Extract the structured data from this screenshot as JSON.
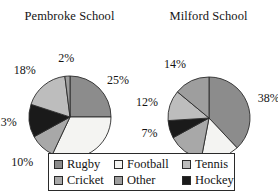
{
  "chart_data": [
    {
      "type": "pie",
      "title": "Pembroke School",
      "categories": [
        "Rugby",
        "Football",
        "Cricket",
        "Hockey",
        "Tennis",
        "Other"
      ],
      "values": [
        25,
        32,
        10,
        13,
        18,
        2
      ],
      "labels": [
        "25%",
        "32%",
        "10%",
        "13%",
        "18%",
        "2%"
      ],
      "colors": [
        "#8c8c8c",
        "#f4f4f2",
        "#a8a8a8",
        "#1a1a1a",
        "#bdbdbd",
        "#9e9e9e"
      ],
      "start_angle_deg": 0,
      "direction": "clockwise",
      "legend_position": "bottom",
      "grid": false
    },
    {
      "type": "pie",
      "title": "Milford School",
      "categories": [
        "Rugby",
        "Football",
        "Cricket",
        "Hockey",
        "Tennis",
        "Other"
      ],
      "values": [
        38,
        15,
        14,
        7,
        12,
        14
      ],
      "labels": [
        "38%",
        "15%",
        "14%",
        "7%",
        "12%",
        "14%"
      ],
      "colors": [
        "#8c8c8c",
        "#f4f4f2",
        "#a8a8a8",
        "#1a1a1a",
        "#bdbdbd",
        "#9e9e9e"
      ],
      "start_angle_deg": 0,
      "direction": "clockwise",
      "legend_position": "bottom",
      "grid": false
    }
  ],
  "legend": {
    "items": [
      {
        "label": "Rugby",
        "color": "#8c8c8c"
      },
      {
        "label": "Football",
        "color": "#f4f4f2"
      },
      {
        "label": "Tennis",
        "color": "#bdbdbd"
      },
      {
        "label": "Cricket",
        "color": "#a8a8a8"
      },
      {
        "label": "Other",
        "color": "#9e9e9e"
      },
      {
        "label": "Hockey",
        "color": "#1a1a1a"
      }
    ]
  },
  "style": {
    "slice_stroke": "#2b2b2b",
    "text_color": "#141414",
    "background": "#ffffff"
  }
}
